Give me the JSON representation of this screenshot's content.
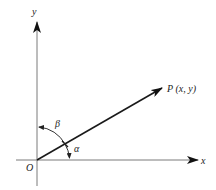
{
  "diagram": {
    "type": "coordinate-vector-direction-angles",
    "origin_label": "O",
    "x_axis_label": "x",
    "y_axis_label": "y",
    "point_label": "P (x, y)",
    "angle_with_x_label": "α",
    "angle_with_y_label": "β",
    "colors": {
      "axis": "#7a7a7a",
      "vector": "#1a1a1a",
      "text": "#222222",
      "background": "#ffffff"
    }
  }
}
